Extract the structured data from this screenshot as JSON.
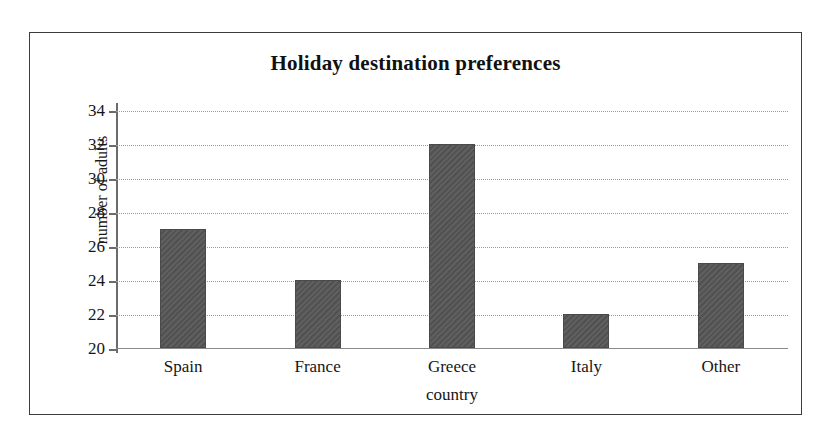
{
  "chart_data": {
    "type": "bar",
    "title": "Holiday destination preferences",
    "xlabel": "country",
    "ylabel": "number of adults",
    "categories": [
      "Spain",
      "France",
      "Greece",
      "Italy",
      "Other"
    ],
    "values": [
      27,
      24,
      32,
      22,
      25
    ],
    "ylim": [
      20,
      34
    ],
    "ytick_step": 2,
    "yticks": [
      20,
      22,
      24,
      26,
      28,
      30,
      32,
      34
    ],
    "ytick_labels": [
      "20",
      "22",
      "24",
      "26",
      "28",
      "30",
      "32",
      "34"
    ],
    "grid": true,
    "grid_axis": "y",
    "grid_style": "dotted",
    "legend": false,
    "bar_color": "#565656",
    "grid_color": "#9a9a9a",
    "axis_color": "#6b6b6b",
    "frame_color": "#3c3c3c",
    "background": "#ffffff"
  }
}
